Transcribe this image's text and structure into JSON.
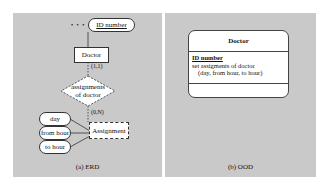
{
  "erd": {
    "caption": "(a) ERD",
    "ellipsis": "• • •",
    "key_attribute": "ID number",
    "entity": "Doctor",
    "relationship": [
      "assignments",
      "of doctor"
    ],
    "cardinality_top": "(1,1)",
    "cardinality_bottom": "(0,N)",
    "weak_entity": "Assignment",
    "attributes": [
      "day",
      "from hour",
      "to hour"
    ]
  },
  "ood": {
    "caption": "(b) OOD",
    "class_name": "Doctor",
    "key_attribute": "ID number",
    "attribute_line1": "set assigments of doctor",
    "attribute_line2": "(day, from hour, to hour)"
  },
  "colors": {
    "panel": "#c9c9c9",
    "box": "#ffffff",
    "stroke": "#333333"
  }
}
